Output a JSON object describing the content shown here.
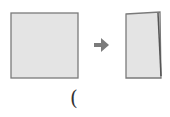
{
  "diagram": {
    "steps": [
      {
        "id": "square-paper",
        "shape": "square"
      },
      {
        "id": "folded-rectangle",
        "shape": "rectangle"
      }
    ],
    "arrow": {
      "icon": "arrow-right-icon"
    },
    "caption": "(",
    "colors": {
      "paper_fill": "#e4e4e4",
      "paper_edge": "#7a7a7a",
      "arrow": "#7b7b7b",
      "fold_edge": "#555555"
    }
  }
}
